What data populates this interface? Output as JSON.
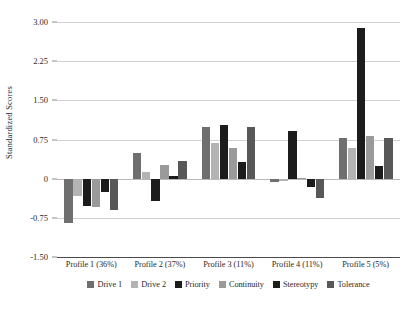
{
  "chart_data": {
    "type": "bar",
    "title": "",
    "subtitle": "",
    "xlabel": "",
    "ylabel": "Standardized Scores",
    "ylim": [
      -1.5,
      3.0
    ],
    "yticks": [
      "3.00",
      "2.25",
      "1.50",
      "0.75",
      "0",
      "-0.75",
      "-1.50"
    ],
    "ytick_values": [
      3.0,
      2.25,
      1.5,
      0.75,
      0,
      -0.75,
      -1.5
    ],
    "grid": true,
    "legend_position": "bottom",
    "categories": [
      "Profile 1 (36%)",
      "Profile 2 (37%)",
      "Profile 3 (11%)",
      "Profile 4 (11%)",
      "Profile 5 (5%)"
    ],
    "series": [
      {
        "name": "Drive 1",
        "color": "#6f6f6f",
        "values": [
          -0.85,
          0.5,
          0.98,
          -0.06,
          0.78
        ]
      },
      {
        "name": "Drive 2",
        "color": "#b3b3b3",
        "values": [
          -0.33,
          0.13,
          0.68,
          -0.04,
          0.58
        ]
      },
      {
        "name": "Priority",
        "color": "#1c1c1c",
        "values": [
          -0.52,
          -0.42,
          1.02,
          0.92,
          2.88
        ]
      },
      {
        "name": "Continuity",
        "color": "#9a9a9a",
        "values": [
          -0.54,
          0.27,
          0.58,
          0.01,
          0.82
        ]
      },
      {
        "name": "Stereotypy",
        "color": "#1c1c1c",
        "values": [
          -0.25,
          0.06,
          0.32,
          -0.16,
          0.25
        ]
      },
      {
        "name": "Tolerance",
        "color": "#585858",
        "values": [
          -0.6,
          0.33,
          0.98,
          -0.37,
          0.78
        ]
      }
    ]
  }
}
